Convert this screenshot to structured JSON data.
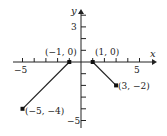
{
  "graph": {
    "axes": {
      "x_label": "x",
      "y_label": "y",
      "x_ticks": [
        -5,
        5
      ],
      "y_ticks": [
        3,
        -5
      ],
      "x_range": [
        -5,
        5
      ],
      "y_range": [
        -5,
        4
      ]
    },
    "segments": [
      {
        "from": [
          -5,
          -4
        ],
        "to": [
          -1,
          0
        ]
      },
      {
        "from": [
          1,
          0
        ],
        "to": [
          3,
          -2
        ]
      }
    ],
    "points": [
      {
        "label": "(−5, −4)",
        "x": -5,
        "y": -4
      },
      {
        "label": "(−1, 0)",
        "x": -1,
        "y": 0
      },
      {
        "label": "(1, 0)",
        "x": 1,
        "y": 0
      },
      {
        "label": "(3, −2)",
        "x": 3,
        "y": -2
      }
    ],
    "tick_labels": {
      "x_neg5": "−5",
      "x_pos5": "5",
      "y_pos3": "3",
      "y_neg5": "−5"
    },
    "colors": {
      "line": "#222222"
    }
  }
}
